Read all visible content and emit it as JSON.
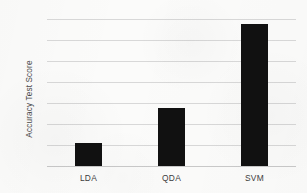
{
  "chart_data": {
    "type": "bar",
    "title": "",
    "subtitle": "",
    "xlabel": "",
    "ylabel": "Accuracy Test Score",
    "categories": [
      "LDA",
      "QDA",
      "SVM"
    ],
    "values": [
      73.2,
      76.5,
      84.5
    ],
    "value_unit": "%",
    "ylim": [
      71,
      85
    ],
    "ytick_step": 2,
    "ytick_labels": [
      "85%",
      "83%",
      "81%",
      "79%",
      "77%",
      "75%",
      "73%",
      "71%"
    ],
    "ytick_values": [
      85,
      83,
      81,
      79,
      77,
      75,
      73,
      71
    ],
    "grid": "horizontal",
    "legend": "none",
    "series": [
      {
        "name": "Accuracy Test Score",
        "color": "#111111",
        "values": [
          73.2,
          76.5,
          84.5
        ]
      }
    ],
    "annotations": []
  },
  "figure": {
    "background_color": "#fbfbfa",
    "gridline_color": "#d8d8d8",
    "bar_color": "#111111",
    "axis_text_color": "#4f4f4f"
  }
}
